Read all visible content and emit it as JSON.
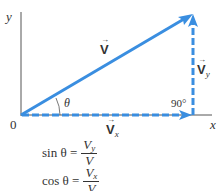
{
  "axes": {
    "x_label": "x",
    "y_label": "y",
    "origin_label": "0"
  },
  "vectors": {
    "main": {
      "label": "V",
      "arrow": "→",
      "color": "#3a8ee0"
    },
    "x_component": {
      "label": "V",
      "subscript": "x",
      "arrow": "→",
      "style": "dashed"
    },
    "y_component": {
      "label": "V",
      "subscript": "y",
      "arrow": "→",
      "style": "dashed"
    }
  },
  "angles": {
    "theta": "θ",
    "right_angle": "90°"
  },
  "equations": [
    {
      "lhs": "sin θ =",
      "numerator": "V",
      "numerator_sub": "y",
      "denominator": "V"
    },
    {
      "lhs": "cos θ =",
      "numerator": "V",
      "numerator_sub": "x",
      "denominator": "V"
    }
  ],
  "colors": {
    "vector": "#3a8ee0",
    "axis": "#555555",
    "text": "#333333"
  }
}
